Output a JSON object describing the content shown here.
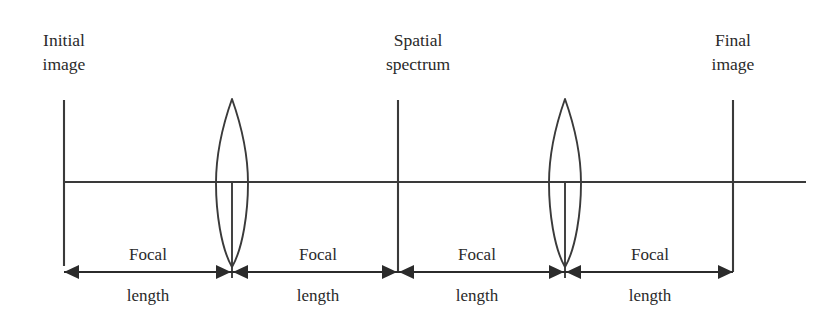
{
  "figure": {
    "type": "optical-ray-diagram",
    "background_color": "#ffffff",
    "line_color": "#3a3a3a",
    "text_color": "#2a2a2a"
  },
  "plane_labels": [
    {
      "id": "initial-image",
      "line1": "Initial",
      "line2": "image",
      "center_x": 64,
      "top_y": 28
    },
    {
      "id": "spatial-spectrum",
      "line1": "Spatial",
      "line2": "spectrum",
      "center_x": 418,
      "top_y": 28
    },
    {
      "id": "final-image",
      "line1": "Final",
      "line2": "image",
      "center_x": 733,
      "top_y": 28
    }
  ],
  "planes": [
    {
      "id": "object-plane",
      "x": 64,
      "y_top": 100,
      "y_bottom": 266
    },
    {
      "id": "fourier-plane",
      "x": 398,
      "y_top": 100,
      "y_bottom": 272
    },
    {
      "id": "image-plane",
      "x": 733,
      "y_top": 100,
      "y_bottom": 272
    }
  ],
  "optical_axis": {
    "y": 182,
    "x_start": 64,
    "x_end": 806
  },
  "lenses": [
    {
      "id": "lens-1",
      "center_x": 232,
      "top_y": 99,
      "bottom_y": 267,
      "half_width": 16
    },
    {
      "id": "lens-2",
      "center_x": 565,
      "top_y": 99,
      "bottom_y": 267,
      "half_width": 16
    }
  ],
  "dimension_line": {
    "y": 272,
    "x_start": 64,
    "x_end": 733
  },
  "dimension_ticks": [
    232,
    398,
    565
  ],
  "focal_segments": [
    {
      "id": "focal-1",
      "label_top": "Focal",
      "label_bottom": "length",
      "center_x": 148,
      "x_start": 64,
      "x_end": 232
    },
    {
      "id": "focal-2",
      "label_top": "Focal",
      "label_bottom": "length",
      "center_x": 318,
      "x_start": 232,
      "x_end": 398
    },
    {
      "id": "focal-3",
      "label_top": "Focal",
      "label_bottom": "length",
      "center_x": 477,
      "x_start": 398,
      "x_end": 565
    },
    {
      "id": "focal-4",
      "label_top": "Focal",
      "label_bottom": "length",
      "center_x": 650,
      "x_start": 565,
      "x_end": 733
    }
  ],
  "label_geometry": {
    "top_label_y": 244,
    "bottom_label_y": 285
  }
}
